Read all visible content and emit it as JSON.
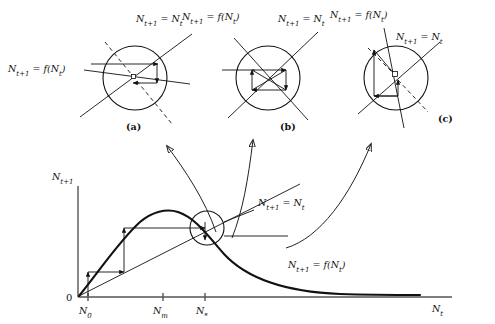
{
  "figure": {
    "type": "diagram",
    "background_color": "#ffffff",
    "line_color": "#111111"
  },
  "insets": [
    {
      "id": "a",
      "panel_label": "(a)",
      "center": [
        135,
        78
      ],
      "radius": 32,
      "behavior": "monotonic convergence to stable fixed point",
      "labels": [
        {
          "text": "N_{t+1} = f(N_t)",
          "display": "N",
          "sub": "t+1",
          "rest": " = f(N",
          "sub2": "t",
          "tail": ")",
          "x": 8,
          "y": 48
        },
        {
          "text": "N_{t+1} = N_t",
          "display": "N",
          "sub": "t+1",
          "rest": " = N",
          "sub2": "t",
          "tail": "",
          "x": 146,
          "y": 20
        }
      ]
    },
    {
      "id": "b",
      "panel_label": "(b)",
      "center": [
        268,
        78
      ],
      "radius": 32,
      "behavior": "two-point cycle / oscillatory square orbit",
      "labels": [
        {
          "text": "N_{t+1} = f(N_t)",
          "display": "N",
          "sub": "t+1",
          "rest": " = f(N",
          "sub2": "t",
          "tail": ")",
          "x": 188,
          "y": 18
        },
        {
          "text": "N_{t+1} = N_t",
          "display": "N",
          "sub": "t+1",
          "rest": " = N",
          "sub2": "t",
          "tail": "",
          "x": 288,
          "y": 20
        }
      ]
    },
    {
      "id": "c",
      "panel_label": "(c)",
      "center": [
        396,
        78
      ],
      "radius": 32,
      "behavior": "oscillatory divergence from unstable fixed point",
      "labels": [
        {
          "text": "N_{t+1} = f(N_t)",
          "display": "N",
          "sub": "t+1",
          "rest": " = f(N",
          "sub2": "t",
          "tail": ")",
          "x": 336,
          "y": 16
        },
        {
          "text": "N_{t+1} = N_t",
          "display": "N",
          "sub": "t+1",
          "rest": " = N",
          "sub2": "t",
          "tail": "",
          "x": 406,
          "y": 36
        }
      ]
    }
  ],
  "main_plot": {
    "y_axis_label": {
      "base": "N",
      "sub": "t+1"
    },
    "x_axis_label": {
      "base": "N",
      "sub": "t"
    },
    "origin_label": "0",
    "x_ticks": [
      {
        "label_base": "N",
        "label_sub": "0",
        "x": 88
      },
      {
        "label_base": "N",
        "label_sub": "m",
        "x": 163
      },
      {
        "label_base": "N",
        "label_sub": "*",
        "x": 205
      }
    ],
    "curve_label": {
      "base": "N",
      "sub": "t+1",
      "mid": " = f(N",
      "sub2": "t",
      "tail": ")"
    },
    "diagonal_label": {
      "base": "N",
      "sub": "t+1",
      "mid": " = N",
      "sub2": "t",
      "tail": ""
    },
    "equilibrium_circle": {
      "center": [
        207,
        228
      ],
      "radius": 17
    },
    "cobweb_description": "staircase trajectory from N0 converging toward N*"
  },
  "panel_labels": {
    "a": "(a)",
    "b": "(b)",
    "c": "(c)"
  }
}
